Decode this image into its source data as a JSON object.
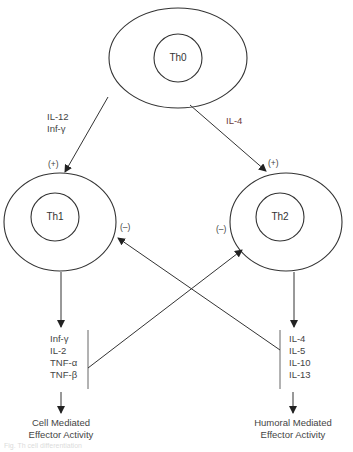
{
  "diagram": {
    "nodes": {
      "th0": {
        "label": "Th0"
      },
      "th1": {
        "label": "Th1"
      },
      "th2": {
        "label": "Th2"
      }
    },
    "edges": {
      "th0_to_th1": {
        "labels": [
          "IL-12",
          "Inf-γ"
        ],
        "sign": "(+)"
      },
      "th0_to_th2": {
        "labels": [
          "IL-4"
        ],
        "sign": "(+)"
      },
      "th1_inhibit": {
        "sign": "(–)"
      },
      "th2_inhibit": {
        "sign": "(–)"
      }
    },
    "th1_cytokines": [
      "Inf-γ",
      "IL-2",
      "TNF-α",
      "TNF-β"
    ],
    "th2_cytokines": [
      "IL-4",
      "IL-5",
      "IL-10",
      "IL-13"
    ],
    "outcomes": {
      "th1": [
        "Cell Mediated",
        "Effector Activity"
      ],
      "th2": [
        "Humoral Mediated",
        "Effector Activity"
      ]
    },
    "caption": "Fig. Th cell differentiation"
  }
}
